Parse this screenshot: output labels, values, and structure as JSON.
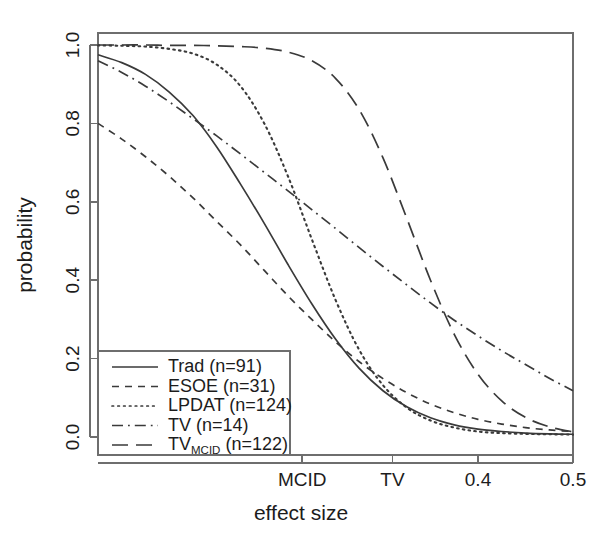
{
  "chart_data": {
    "type": "line",
    "title": "",
    "xlabel": "effect size",
    "ylabel": "probability",
    "grid": false,
    "legend_position": "bottom-left",
    "xlim": [
      0.0,
      0.5
    ],
    "ylim": [
      0.0,
      1.0
    ],
    "x_tick_labels": [
      "MCID",
      "TV",
      "0.4",
      "0.5"
    ],
    "x_tick_values": [
      0.215,
      0.31,
      0.4,
      0.5
    ],
    "y_tick_labels": [
      "0.0",
      "0.2",
      "0.4",
      "0.6",
      "0.8",
      "1.0"
    ],
    "y_tick_values": [
      0.0,
      0.2,
      0.4,
      0.6,
      0.8,
      1.0
    ],
    "x": [
      0.0,
      0.025,
      0.05,
      0.075,
      0.1,
      0.125,
      0.15,
      0.175,
      0.2,
      0.225,
      0.25,
      0.275,
      0.3,
      0.325,
      0.35,
      0.375,
      0.4,
      0.425,
      0.45,
      0.475,
      0.5
    ],
    "series": [
      {
        "name": "Trad (n=91)",
        "label": "Trad",
        "label_sub": "",
        "n": 91,
        "linestyle": "solid",
        "values": [
          0.975,
          0.955,
          0.925,
          0.88,
          0.82,
          0.74,
          0.645,
          0.545,
          0.44,
          0.34,
          0.25,
          0.175,
          0.118,
          0.077,
          0.049,
          0.031,
          0.02,
          0.014,
          0.01,
          0.008,
          0.007
        ]
      },
      {
        "name": "ESOE (n=31)",
        "label": "ESOE",
        "label_sub": "",
        "n": 31,
        "linestyle": "dashed",
        "values": [
          0.8,
          0.76,
          0.715,
          0.665,
          0.61,
          0.55,
          0.49,
          0.425,
          0.36,
          0.3,
          0.243,
          0.192,
          0.149,
          0.113,
          0.084,
          0.062,
          0.045,
          0.033,
          0.024,
          0.018,
          0.014
        ]
      },
      {
        "name": "LPDAT (n=124)",
        "label": "LPDAT",
        "label_sub": "",
        "n": 124,
        "linestyle": "dotted",
        "values": [
          0.999,
          0.998,
          0.996,
          0.99,
          0.978,
          0.95,
          0.895,
          0.8,
          0.665,
          0.505,
          0.35,
          0.222,
          0.132,
          0.075,
          0.042,
          0.024,
          0.014,
          0.01,
          0.008,
          0.007,
          0.006
        ]
      },
      {
        "name": "TV (n=14)",
        "label": "TV",
        "label_sub": "",
        "n": 14,
        "linestyle": "dashdot",
        "values": [
          0.96,
          0.93,
          0.895,
          0.855,
          0.812,
          0.768,
          0.722,
          0.675,
          0.628,
          0.58,
          0.532,
          0.483,
          0.435,
          0.388,
          0.342,
          0.298,
          0.258,
          0.22,
          0.185,
          0.15,
          0.118
        ]
      },
      {
        "name": "TV_MCID (n=122)",
        "label": "TV",
        "label_sub": "MCID",
        "n": 122,
        "linestyle": "longdash",
        "values": [
          1.0,
          1.0,
          1.0,
          0.999,
          0.999,
          0.998,
          0.996,
          0.992,
          0.982,
          0.96,
          0.915,
          0.835,
          0.712,
          0.558,
          0.4,
          0.262,
          0.16,
          0.092,
          0.05,
          0.026,
          0.013
        ]
      }
    ]
  },
  "colors": {
    "line": "#3a3a3a",
    "axis": "#6e6e6e",
    "text": "#1c1c1c",
    "background": "#ffffff"
  },
  "legend": {
    "entries": [
      {
        "label": "Trad (n=91)",
        "text_main": "Trad (n=91)",
        "sub": ""
      },
      {
        "label": "ESOE (n=31)",
        "text_main": "ESOE (n=31)",
        "sub": ""
      },
      {
        "label": "LPDAT (n=124)",
        "text_main": "LPDAT (n=124)",
        "sub": ""
      },
      {
        "label": "TV (n=14)",
        "text_main": "TV (n=14)",
        "sub": ""
      },
      {
        "label": "TV_MCID (n=122)",
        "text_main": "TV",
        "sub": "MCID",
        "text_tail": " (n=122)"
      }
    ]
  }
}
